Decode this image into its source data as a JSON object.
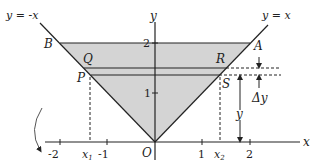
{
  "figure": {
    "type": "region-between-lines-with-horizontal-strip",
    "shade_color": "#d4d4d4",
    "line_color": "#222222",
    "curves": [
      {
        "label": "y = -x",
        "name": "line-y-eq-neg-x"
      },
      {
        "label": "y = x",
        "name": "line-y-eq-x"
      }
    ],
    "axes": {
      "x_label": "x",
      "y_label": "y",
      "origin_label": "O",
      "x_ticks": [
        "-2",
        "-1",
        "1",
        "2"
      ],
      "y_ticks": [
        "1",
        "2"
      ],
      "x_markers": [
        "x1",
        "x2"
      ]
    },
    "points": {
      "A": "A",
      "B": "B",
      "Q": "Q",
      "R": "R",
      "P": "P",
      "S": "S"
    },
    "annotations": {
      "delta_y": "Δy",
      "y": "y",
      "x1_main": "x",
      "x1_sub": "1",
      "x2_main": "x",
      "x2_sub": "2"
    }
  }
}
